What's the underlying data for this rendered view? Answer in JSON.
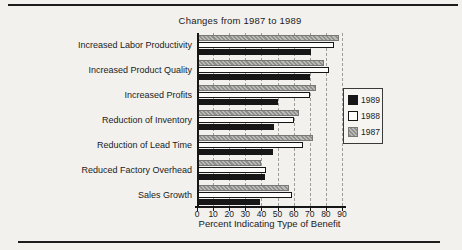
{
  "page": {
    "title": "Changes from 1987 to 1989"
  },
  "chart_data": {
    "type": "bar",
    "orientation": "horizontal",
    "title": "Changes from 1987 to 1989",
    "xlabel": "Percent Indicating Type of Benefit",
    "ylabel": "",
    "xlim": [
      0,
      90
    ],
    "xticks": [
      0,
      10,
      20,
      30,
      40,
      50,
      60,
      70,
      80,
      90
    ],
    "grid": "dashed-vertical",
    "legend_position": "right-middle",
    "categories": [
      "Increased Labor Productivity",
      "Increased Product Quality",
      "Increased Profits",
      "Reduction of Inventory",
      "Reduction of Lead Time",
      "Reduced Factory Overhead",
      "Sales Growth"
    ],
    "series": [
      {
        "name": "1989",
        "color": "#161616",
        "style": "solid-black",
        "values": [
          71,
          70,
          50,
          48,
          47,
          42,
          39
        ]
      },
      {
        "name": "1988",
        "color": "#fdfdfb",
        "style": "white-outlined",
        "values": [
          85,
          82,
          70,
          60,
          66,
          43,
          59
        ]
      },
      {
        "name": "1987",
        "color": "#a3a3a1",
        "style": "gray-hatched",
        "values": [
          88,
          79,
          74,
          63,
          72,
          40,
          57
        ]
      }
    ],
    "bar_order_top_to_bottom": [
      "1987",
      "1988",
      "1989"
    ]
  }
}
